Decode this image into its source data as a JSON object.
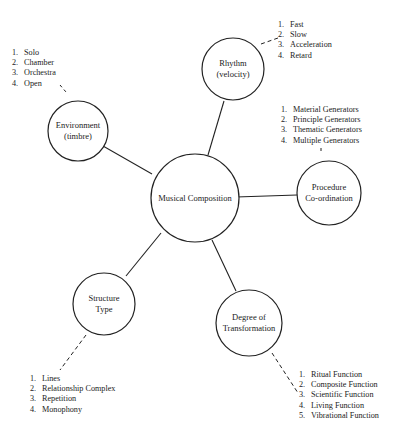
{
  "diagram": {
    "center": {
      "id": "musical-composition",
      "label": "Musical Composition"
    },
    "nodes": [
      {
        "id": "rhythm",
        "lines": [
          "Rhythm",
          "(velocity)"
        ],
        "items": [
          "Fast",
          "Slow",
          "Acceleration",
          "Retard"
        ]
      },
      {
        "id": "environment",
        "lines": [
          "Environment",
          "(timbre)"
        ],
        "items": [
          "Solo",
          "Chamber",
          "Orchestra",
          "Open"
        ]
      },
      {
        "id": "procedure",
        "lines": [
          "Procedure",
          "Co-ordination"
        ],
        "items": [
          "Material Generators",
          "Principle Generators",
          "Thematic Generators",
          "Multiple Generators"
        ]
      },
      {
        "id": "structure",
        "lines": [
          "Structure",
          "Type"
        ],
        "items": [
          "Lines",
          "Relationship Complex",
          "Repetition",
          "Monophony"
        ]
      },
      {
        "id": "degree",
        "lines": [
          "Degree of",
          "Transformation"
        ],
        "items": [
          "Ritual Function",
          "Composite Function",
          "Scientific Function",
          "Living Function",
          "Vibrational Function"
        ]
      }
    ]
  }
}
